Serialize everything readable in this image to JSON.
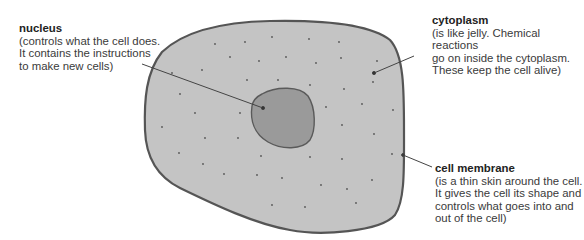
{
  "diagram": {
    "colors": {
      "cytoplasm_fill": "#c4c4c4",
      "nucleus_fill": "#9a9a9a",
      "membrane_stroke": "#555555",
      "leader_line": "#444444",
      "background": "#ffffff"
    },
    "labels": {
      "nucleus": {
        "title": "nucleus",
        "description": "(controls what the cell does.\nIt contains the instructions\nto make new cells)"
      },
      "cytoplasm": {
        "title": "cytoplasm",
        "description": "(is like jelly. Chemical reactions\ngo on inside the cytoplasm.\nThese keep the cell alive)"
      },
      "membrane": {
        "title": "cell membrane",
        "description": "(is a thin skin around the cell.\nIt gives the cell its shape and\ncontrols what goes into and\nout of the cell)"
      }
    }
  }
}
